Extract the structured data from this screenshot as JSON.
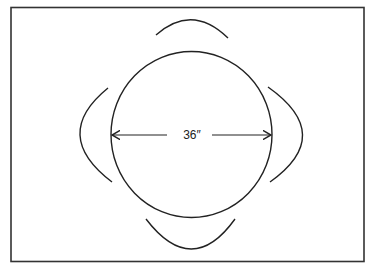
{
  "diagram": {
    "table": {
      "shape": "circle",
      "diameter_label": "36″"
    },
    "chairs": [
      {
        "position": "top"
      },
      {
        "position": "right"
      },
      {
        "position": "bottom"
      },
      {
        "position": "left"
      }
    ],
    "colors": {
      "stroke": "#222222",
      "background": "#ffffff"
    }
  }
}
